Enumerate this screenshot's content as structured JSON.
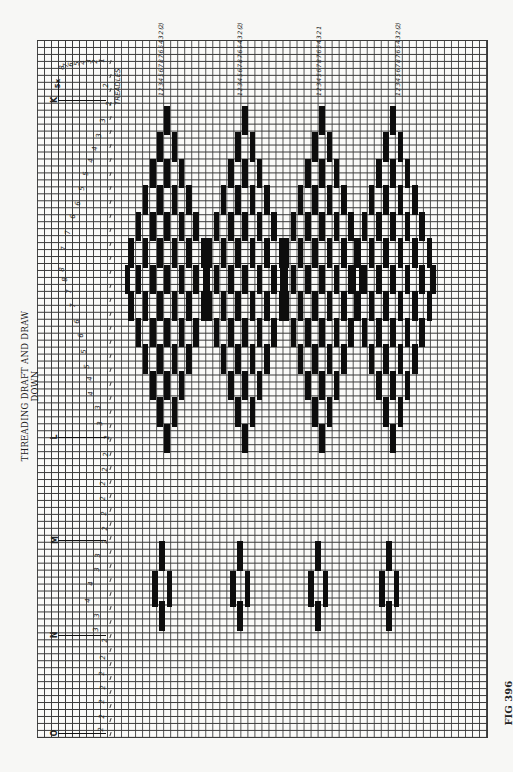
{
  "title": "THREADING DRAFT AND DRAW DOWN",
  "figure_label": "FIG 396",
  "treadles_label": "TREADLES",
  "section_markers": [
    {
      "label": "K",
      "note": "5x",
      "y": 100
    },
    {
      "label": "L",
      "y": 437
    },
    {
      "label": "M",
      "y": 540
    },
    {
      "label": "N",
      "y": 635
    },
    {
      "label": "O",
      "y": 733
    }
  ],
  "threading_numbers": [
    {
      "v": "8",
      "x": 60,
      "y": 64
    },
    {
      "v": "7",
      "x": 64,
      "y": 62
    },
    {
      "v": "6",
      "x": 69,
      "y": 61
    },
    {
      "v": "5",
      "x": 75,
      "y": 60
    },
    {
      "v": "4",
      "x": 81,
      "y": 59
    },
    {
      "v": "3",
      "x": 87,
      "y": 58
    },
    {
      "v": "2",
      "x": 93,
      "y": 58
    },
    {
      "v": "1",
      "x": 100,
      "y": 57
    },
    {
      "v": "2",
      "x": 104,
      "y": 82
    },
    {
      "v": "2",
      "x": 107,
      "y": 100
    },
    {
      "v": "3",
      "x": 101,
      "y": 117
    },
    {
      "v": "3",
      "x": 97,
      "y": 132
    },
    {
      "v": "4",
      "x": 93,
      "y": 145
    },
    {
      "v": "4",
      "x": 89,
      "y": 157
    },
    {
      "v": "5",
      "x": 84,
      "y": 170
    },
    {
      "v": "5",
      "x": 80,
      "y": 185
    },
    {
      "v": "6",
      "x": 76,
      "y": 200
    },
    {
      "v": "6",
      "x": 71,
      "y": 213
    },
    {
      "v": "7",
      "x": 66,
      "y": 229
    },
    {
      "v": "7",
      "x": 62,
      "y": 245
    },
    {
      "v": "8",
      "x": 60,
      "y": 266
    },
    {
      "v": "8",
      "x": 63,
      "y": 276
    },
    {
      "v": "7",
      "x": 67,
      "y": 288
    },
    {
      "v": "7",
      "x": 71,
      "y": 302
    },
    {
      "v": "6",
      "x": 75,
      "y": 318
    },
    {
      "v": "6",
      "x": 79,
      "y": 332
    },
    {
      "v": "5",
      "x": 82,
      "y": 348
    },
    {
      "v": "5",
      "x": 85,
      "y": 363
    },
    {
      "v": "4",
      "x": 88,
      "y": 375
    },
    {
      "v": "4",
      "x": 89,
      "y": 390
    },
    {
      "v": "3",
      "x": 96,
      "y": 404
    },
    {
      "v": "3",
      "x": 98,
      "y": 420
    },
    {
      "v": "2",
      "x": 105,
      "y": 434
    },
    {
      "v": "2",
      "x": 104,
      "y": 451
    },
    {
      "v": "2",
      "x": 103,
      "y": 466
    },
    {
      "v": "2",
      "x": 101,
      "y": 480
    },
    {
      "v": "2",
      "x": 101,
      "y": 495
    },
    {
      "v": "2",
      "x": 102,
      "y": 510
    },
    {
      "v": "2",
      "x": 103,
      "y": 525
    },
    {
      "v": "2",
      "x": 103,
      "y": 538
    },
    {
      "v": "3",
      "x": 96,
      "y": 552
    },
    {
      "v": "3",
      "x": 95,
      "y": 566
    },
    {
      "v": "4",
      "x": 89,
      "y": 580
    },
    {
      "v": "4",
      "x": 86,
      "y": 597
    },
    {
      "v": "3",
      "x": 95,
      "y": 612
    },
    {
      "v": "3",
      "x": 94,
      "y": 626
    },
    {
      "v": "2",
      "x": 103,
      "y": 637
    },
    {
      "v": "2",
      "x": 101,
      "y": 654
    },
    {
      "v": "2",
      "x": 100,
      "y": 670
    },
    {
      "v": "2",
      "x": 101,
      "y": 684
    },
    {
      "v": "2",
      "x": 100,
      "y": 698
    },
    {
      "v": "2",
      "x": 100,
      "y": 713
    },
    {
      "v": "2",
      "x": 99,
      "y": 726
    }
  ],
  "treadle_sequence": {
    "blocks": [
      {
        "label": "1 2 3 4 5 6 7 8 7 6 5 4 3 2",
        "end_marker": "(2)"
      },
      {
        "label": "1 2 3 4 5 6 7 8 7 6 5 4 3 2",
        "end_marker": "(2)"
      },
      {
        "label": "1 2 3 4 5 6 7 8 7 6 5 4 3 2",
        "end_marker": "1"
      },
      {
        "label": "1 2 3 4 5 6 7 8 7 6 5 4 3 2",
        "end_marker": "(2)"
      }
    ]
  },
  "grid": {
    "cols": 64,
    "rows": 100,
    "cell_w": 7.03,
    "cell_h": 6.97,
    "line_color": "#2a2a2a",
    "fill_color": "#0d0d0d"
  },
  "drawdown": {
    "diamond_centers_x": [
      167,
      245,
      322,
      393
    ],
    "small_motif_centers_x": [
      162,
      240,
      318,
      389
    ],
    "small_motif_center_y": 589
  }
}
